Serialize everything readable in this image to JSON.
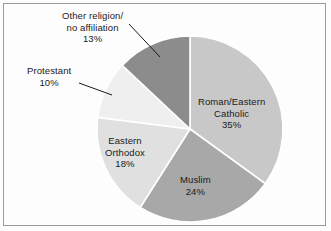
{
  "figure": {
    "background_color": "#fdfdfd",
    "border_color": "#9a9a9a",
    "label_text_color": "#1a1a1a",
    "separator_color": "#ffffff"
  },
  "chart_data": {
    "type": "pie",
    "title": "",
    "subtitle": "",
    "xlabel": "",
    "ylabel": "",
    "grid": false,
    "legend_position": "none",
    "label_style": "slice-labels-with-leader-lines",
    "units": "percent",
    "start_angle_deg": 0,
    "direction": "clockwise",
    "center": {
      "x": 190,
      "y": 129,
      "radius": 93
    },
    "categories": [
      "Roman/Eastern Catholic",
      "Muslim",
      "Eastern Orthodox",
      "Protestant",
      "Other religion/ no affiliation"
    ],
    "values": [
      35,
      24,
      18,
      10,
      13
    ],
    "colors": [
      "#c8c8c8",
      "#a8a8a8",
      "#e0e0e0",
      "#efefef",
      "#8c8c8c"
    ],
    "slices": [
      {
        "name": "Roman/Eastern Catholic",
        "label_line1": "Roman/Eastern",
        "label_line2": "Catholic",
        "value": 35,
        "value_label": "35%",
        "color": "#c8c8c8",
        "label_placement": "inside",
        "start_deg": 0,
        "end_deg": 126
      },
      {
        "name": "Muslim",
        "label_line1": "Muslim",
        "label_line2": "",
        "value": 24,
        "value_label": "24%",
        "color": "#a8a8a8",
        "label_placement": "inside",
        "start_deg": 126,
        "end_deg": 212.4
      },
      {
        "name": "Eastern Orthodox",
        "label_line1": "Eastern",
        "label_line2": "Orthodox",
        "value": 18,
        "value_label": "18%",
        "color": "#e0e0e0",
        "label_placement": "inside",
        "start_deg": 212.4,
        "end_deg": 277.2
      },
      {
        "name": "Protestant",
        "label_line1": "Protestant",
        "label_line2": "",
        "value": 10,
        "value_label": "10%",
        "color": "#efefef",
        "label_placement": "outside",
        "start_deg": 277.2,
        "end_deg": 313.2
      },
      {
        "name": "Other religion/ no affiliation",
        "label_line1": "Other religion/",
        "label_line2": "no affiliation",
        "value": 13,
        "value_label": "13%",
        "color": "#8c8c8c",
        "label_placement": "outside",
        "start_deg": 313.2,
        "end_deg": 360
      }
    ]
  }
}
